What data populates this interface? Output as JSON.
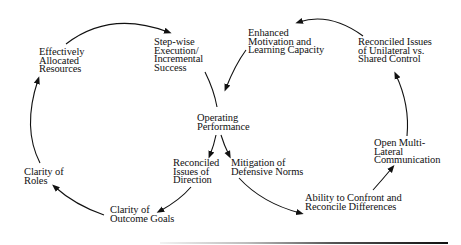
{
  "diagram": {
    "type": "double-loop cycle diagram",
    "center_node": "Operating\nPerformance",
    "left_loop": {
      "direction": "counter-clockwise",
      "nodes": [
        {
          "id": "reconciled-issues-of-direction",
          "label": "Reconciled\nIssues of\nDirection"
        },
        {
          "id": "clarity-of-outcome-goals",
          "label": "Clarity of\nOutcome Goals"
        },
        {
          "id": "clarity-of-roles",
          "label": "Clarity of\nRoles"
        },
        {
          "id": "effectively-allocated-resources",
          "label": "Effectively\nAllocated\nResources"
        },
        {
          "id": "step-wise-execution",
          "label": "Step-wise\nExecution/\nIncremental\nSuccess"
        }
      ]
    },
    "right_loop": {
      "direction": "clockwise",
      "nodes": [
        {
          "id": "mitigation-of-defensive-norms",
          "label": "Mitigation of\nDefensive Norms"
        },
        {
          "id": "ability-to-confront",
          "label": "Ability to Confront and\nReconcile Differences"
        },
        {
          "id": "open-multi-lateral-communication",
          "label": "Open Multi-\nLateral\nCommunication"
        },
        {
          "id": "reconciled-issues-unilateral-shared",
          "label": "Reconciled Issues\nof Unilateral vs.\nShared Control"
        },
        {
          "id": "enhanced-motivation",
          "label": "Enhanced\nMotivation and\nLearning Capacity"
        }
      ]
    },
    "colors": {
      "line": "#111111",
      "text": "#111111",
      "background": "#ffffff"
    }
  }
}
